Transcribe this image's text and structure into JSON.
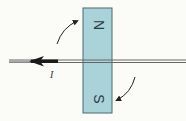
{
  "diagram": {
    "title": "",
    "magnet": {
      "north_label": "N",
      "south_label": "S",
      "fill_color": "#a9d3d8",
      "border_color": "#4a6a70"
    },
    "wire": {
      "current_label": "I",
      "current_direction": "left",
      "color": "#555555"
    },
    "rotation_arrows": {
      "top": "curved arrow pointing toward N pole (upper-left to upper-right)",
      "bottom": "curved arrow pointing toward S pole (lower-right to lower-left)"
    }
  }
}
